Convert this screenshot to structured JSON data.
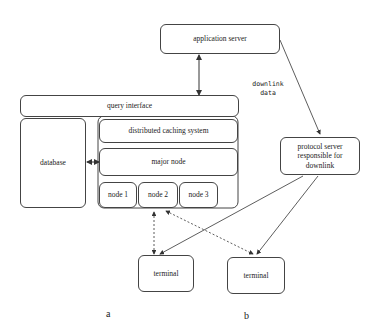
{
  "diagram": {
    "nodes": {
      "application_server": "application server",
      "query_interface": "query interface",
      "database": "database",
      "distributed_caching": "distributed caching system",
      "major_node": "major node",
      "node1": "node 1",
      "node2": "node 2",
      "node3": "node 3",
      "protocol_server": "protocol server responsible for downlink",
      "terminal_a": "terminal",
      "terminal_b": "terminal"
    },
    "annotations": {
      "downlink_data": "downlink data"
    },
    "sublabels": {
      "a": "a",
      "b": "b"
    },
    "edges": [
      {
        "from": "application_server",
        "to": "query_interface",
        "style": "solid",
        "direction": "both"
      },
      {
        "from": "database",
        "to": "major_node",
        "style": "solid",
        "direction": "both"
      },
      {
        "from": "application_server",
        "to": "protocol_server",
        "style": "solid",
        "direction": "forward"
      },
      {
        "from": "protocol_server",
        "to": "terminal_a",
        "style": "solid",
        "direction": "forward"
      },
      {
        "from": "protocol_server",
        "to": "terminal_b",
        "style": "solid",
        "direction": "forward"
      },
      {
        "from": "node2",
        "to": "terminal_a",
        "style": "dashed",
        "direction": "both"
      },
      {
        "from": "node2",
        "to": "terminal_b",
        "style": "dashed",
        "direction": "both"
      }
    ]
  }
}
